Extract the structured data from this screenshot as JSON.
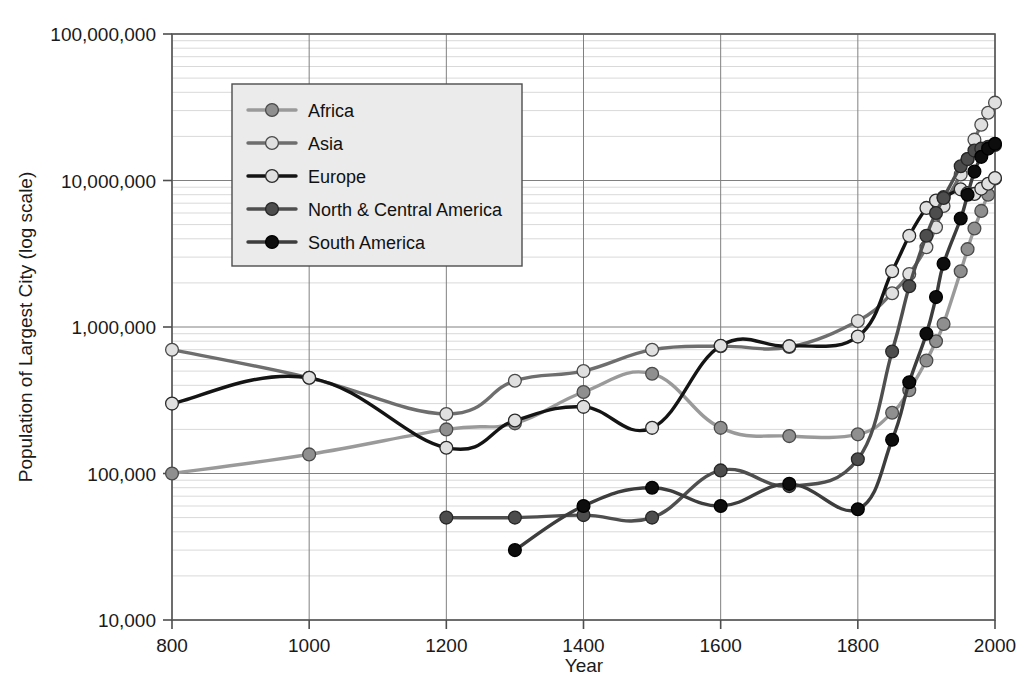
{
  "chart_data": {
    "type": "line",
    "title": "",
    "xlabel": "Year",
    "ylabel": "Population of Largest City (log scale)",
    "yscale": "log",
    "ylim": [
      10000,
      100000000
    ],
    "xlim": [
      800,
      2000
    ],
    "grid": true,
    "legend_position": "upper-left-inside",
    "x_ticks": [
      "800",
      "1000",
      "1200",
      "1400",
      "1600",
      "1800",
      "2000"
    ],
    "x_tick_values": [
      800,
      1000,
      1200,
      1400,
      1600,
      1800,
      2000
    ],
    "y_ticks": [
      "10,000",
      "100,000",
      "1,000,000",
      "10,000,000",
      "100,000,000"
    ],
    "y_tick_values": [
      10000,
      100000,
      1000000,
      10000000,
      100000000
    ],
    "series": [
      {
        "name": "Africa",
        "line_color": "#9a9a9a",
        "marker_fill": "#8f8f8f",
        "marker_stroke": "#4a4a4a",
        "x": [
          800,
          1000,
          1200,
          1300,
          1400,
          1500,
          1600,
          1700,
          1800,
          1850,
          1875,
          1900,
          1914,
          1925,
          1950,
          1960,
          1970,
          1980,
          1990,
          2000
        ],
        "y": [
          100000,
          135000,
          200000,
          220000,
          360000,
          480000,
          205000,
          180000,
          185000,
          260000,
          370000,
          590000,
          800000,
          1050000,
          2400000,
          3400000,
          4700000,
          6200000,
          8000000,
          10300000
        ]
      },
      {
        "name": "Asia",
        "line_color": "#6e6e6e",
        "marker_fill": "#e0e0e0",
        "marker_stroke": "#4a4a4a",
        "x": [
          800,
          1000,
          1200,
          1300,
          1400,
          1500,
          1600,
          1700,
          1800,
          1850,
          1875,
          1900,
          1914,
          1925,
          1950,
          1960,
          1970,
          1980,
          1990,
          2000
        ],
        "y": [
          700000,
          450000,
          255000,
          430000,
          500000,
          700000,
          740000,
          730000,
          1100000,
          1700000,
          2300000,
          3500000,
          4800000,
          6700000,
          11000000,
          14000000,
          19000000,
          24000000,
          29000000,
          34000000
        ]
      },
      {
        "name": "Europe",
        "line_color": "#141414",
        "marker_fill": "#e0e0e0",
        "marker_stroke": "#2a2a2a",
        "x": [
          800,
          1000,
          1200,
          1300,
          1400,
          1500,
          1600,
          1700,
          1800,
          1850,
          1875,
          1900,
          1914,
          1925,
          1950,
          1960,
          1970,
          1980,
          1990,
          2000
        ],
        "y": [
          300000,
          450000,
          150000,
          230000,
          285000,
          205000,
          745000,
          740000,
          860000,
          2400000,
          4200000,
          6500000,
          7300000,
          7700000,
          8700000,
          8200000,
          8100000,
          8800000,
          9500000,
          10400000
        ]
      },
      {
        "name": "North & Central America",
        "line_color": "#4f4f4f",
        "marker_fill": "#4d4d4d",
        "marker_stroke": "#262626",
        "x": [
          1200,
          1300,
          1400,
          1500,
          1600,
          1700,
          1800,
          1850,
          1875,
          1900,
          1914,
          1925,
          1950,
          1960,
          1970,
          1980,
          1990,
          2000
        ],
        "y": [
          50000,
          50000,
          52000,
          50000,
          105000,
          82000,
          125000,
          680000,
          1900000,
          4200000,
          6000000,
          7600000,
          12500000,
          14000000,
          16000000,
          16500000,
          17000000,
          17500000
        ]
      },
      {
        "name": "South America",
        "line_color": "#3d3d3d",
        "marker_fill": "#0d0d0d",
        "marker_stroke": "#000000",
        "x": [
          1300,
          1400,
          1500,
          1600,
          1700,
          1800,
          1850,
          1875,
          1900,
          1914,
          1925,
          1950,
          1960,
          1970,
          1980,
          1990,
          2000
        ],
        "y": [
          30000,
          60000,
          80000,
          60000,
          85000,
          57000,
          170000,
          420000,
          900000,
          1600000,
          2700000,
          5500000,
          8000000,
          11500000,
          14500000,
          16500000,
          17800000
        ]
      }
    ]
  },
  "legend": {
    "items": [
      {
        "label": "Africa"
      },
      {
        "label": "Asia"
      },
      {
        "label": "Europe"
      },
      {
        "label": "North & Central America"
      },
      {
        "label": "South America"
      }
    ]
  }
}
